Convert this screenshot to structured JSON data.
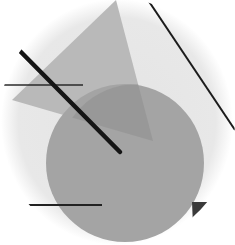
{
  "artwork": {
    "description": "Abstract geometric composition in grayscale within an oval vignette",
    "colors": {
      "background": "#ffffff",
      "vignette": "#e9e9e9",
      "triangle": "#b9b9b9",
      "circle": "#a4a4a4",
      "overlap": "#8f8f8f",
      "lines": "#1c1c1c",
      "small_triangle": "#3a3a3a"
    },
    "shapes": {
      "circle": {
        "cx": 125,
        "cy": 163,
        "r": 79
      },
      "triangle": {
        "points": "116,0 12,100 153,141"
      },
      "small_triangle": {
        "points": "192,202 214,202 193,226"
      },
      "thick_line": {
        "x1": 15,
        "y1": 45,
        "x2": 120,
        "y2": 153
      },
      "diagonal_line": {
        "x1": 148,
        "y1": 0,
        "x2": 235,
        "y2": 130
      },
      "horizontal_line_top": {
        "x1": 0,
        "y1": 85,
        "x2": 83,
        "y2": 85
      },
      "horizontal_line_bottom": {
        "x1": 25,
        "y1": 205,
        "x2": 102,
        "y2": 205
      }
    }
  }
}
